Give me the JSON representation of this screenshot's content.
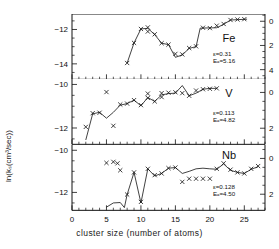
{
  "chart_data": {
    "type": "scatter",
    "title": "",
    "xlabel": "cluster size  (number of atoms)",
    "ylabel_left": "ln(kₛ(cm³/sec))",
    "ylabel_right": "activation  energies  (kcal/mole)",
    "xlim": [
      0,
      28
    ],
    "xticks": [
      0,
      5,
      10,
      15,
      20,
      25
    ],
    "xticklabels": [
      "0",
      "5",
      "10",
      "15",
      "20",
      "25"
    ],
    "xminor_step": 1,
    "grid": false,
    "legend": "none",
    "panels": [
      {
        "name": "Fe",
        "label": "Fe",
        "epsilon_label": "ε=0.31",
        "ea_label": "Eₐ=5.16",
        "epsilon": 0.31,
        "activation_energy": 5.16,
        "ylim": [
          -14.9,
          -11.1
        ],
        "yticks": [
          -12,
          -14
        ],
        "yticklabels": [
          "−12",
          "−14"
        ],
        "ylim_right": [
          -0.6,
          4.8
        ],
        "yticks_right": [
          0,
          2,
          4
        ],
        "yticklabels_right": [
          "0",
          "2",
          "4"
        ],
        "points": [
          {
            "x": 8,
            "y": -13.95
          },
          {
            "x": 9,
            "y": -12.78
          },
          {
            "x": 10,
            "y": -11.97
          },
          {
            "x": 11,
            "y": -11.88
          },
          {
            "x": 11,
            "y": -12.12
          },
          {
            "x": 12,
            "y": -12.28
          },
          {
            "x": 13,
            "y": -12.8
          },
          {
            "x": 14,
            "y": -12.88
          },
          {
            "x": 15,
            "y": -13.42
          },
          {
            "x": 16,
            "y": -13.45
          },
          {
            "x": 17,
            "y": -13.08
          },
          {
            "x": 18,
            "y": -12.98
          },
          {
            "x": 19,
            "y": -11.9
          },
          {
            "x": 20,
            "y": -11.92
          },
          {
            "x": 21,
            "y": -11.78
          },
          {
            "x": 22,
            "y": -11.68
          },
          {
            "x": 23,
            "y": -11.45
          },
          {
            "x": 24,
            "y": -11.42
          },
          {
            "x": 25,
            "y": -11.4
          }
        ],
        "curve": [
          {
            "x": 8,
            "y": -13.95
          },
          {
            "x": 9,
            "y": -12.78
          },
          {
            "x": 10,
            "y": -11.97
          },
          {
            "x": 11,
            "y": -11.93
          },
          {
            "x": 12,
            "y": -12.3
          },
          {
            "x": 13,
            "y": -12.8
          },
          {
            "x": 14,
            "y": -12.88
          },
          {
            "x": 15,
            "y": -13.62
          },
          {
            "x": 16,
            "y": -13.48
          },
          {
            "x": 17,
            "y": -13.1
          },
          {
            "x": 18,
            "y": -13.0
          },
          {
            "x": 18.6,
            "y": -11.92
          },
          {
            "x": 21,
            "y": -11.9
          },
          {
            "x": 22,
            "y": -11.7
          },
          {
            "x": 23,
            "y": -11.45
          },
          {
            "x": 25.4,
            "y": -11.4
          }
        ]
      },
      {
        "name": "V",
        "label": "V",
        "epsilon_label": "ε=0.113",
        "ea_label": "Eₐ=4.82",
        "epsilon": 0.113,
        "activation_energy": 4.82,
        "ylim": [
          -12.75,
          -9.75
        ],
        "yticks": [
          -10,
          -12
        ],
        "yticklabels": [
          "−10",
          "−12"
        ],
        "ylim_right": [
          -0.75,
          2.9
        ],
        "yticks_right": [
          0,
          2
        ],
        "yticklabels_right": [
          "0",
          "2"
        ],
        "points": [
          {
            "x": 2,
            "y": -11.95
          },
          {
            "x": 3,
            "y": -11.32
          },
          {
            "x": 4,
            "y": -11.3
          },
          {
            "x": 5,
            "y": -10.35
          },
          {
            "x": 6,
            "y": -11.9
          },
          {
            "x": 7,
            "y": -10.92
          },
          {
            "x": 8,
            "y": -10.88
          },
          {
            "x": 9,
            "y": -10.72
          },
          {
            "x": 10,
            "y": -10.95
          },
          {
            "x": 11,
            "y": -10.42
          },
          {
            "x": 11,
            "y": -10.62
          },
          {
            "x": 12,
            "y": -10.78
          },
          {
            "x": 13,
            "y": -10.4
          },
          {
            "x": 13,
            "y": -10.58
          },
          {
            "x": 14,
            "y": -10.38
          },
          {
            "x": 15,
            "y": -10.36
          },
          {
            "x": 16,
            "y": -10.4
          },
          {
            "x": 17,
            "y": -10.52
          },
          {
            "x": 18,
            "y": -10.28
          },
          {
            "x": 19,
            "y": -10.22
          },
          {
            "x": 20,
            "y": -10.2
          },
          {
            "x": 21,
            "y": -10.18
          }
        ],
        "curve": [
          {
            "x": 2,
            "y": -12.55
          },
          {
            "x": 3,
            "y": -11.35
          },
          {
            "x": 4,
            "y": -11.28
          },
          {
            "x": 5,
            "y": -11.55
          },
          {
            "x": 6,
            "y": -11.28
          },
          {
            "x": 7,
            "y": -10.95
          },
          {
            "x": 8,
            "y": -10.88
          },
          {
            "x": 9,
            "y": -10.72
          },
          {
            "x": 10,
            "y": -10.98
          },
          {
            "x": 11,
            "y": -10.6
          },
          {
            "x": 12,
            "y": -10.78
          },
          {
            "x": 13,
            "y": -10.48
          },
          {
            "x": 14,
            "y": -10.42
          },
          {
            "x": 15,
            "y": -10.4
          },
          {
            "x": 16,
            "y": -10.05
          },
          {
            "x": 17,
            "y": -10.52
          },
          {
            "x": 18,
            "y": -10.4
          },
          {
            "x": 19,
            "y": -10.22
          },
          {
            "x": 20,
            "y": -10.18
          },
          {
            "x": 21,
            "y": -10.18
          }
        ]
      },
      {
        "name": "Nb",
        "label": "Nb",
        "epsilon_label": "ε=0.128",
        "ea_label": "Eₐ=4.50",
        "epsilon": 0.128,
        "activation_energy": 4.5,
        "ylim": [
          -12.85,
          -9.75
        ],
        "yticks": [
          -10,
          -12
        ],
        "yticklabels": [
          "−10",
          "−12"
        ],
        "ylim_right": [
          -0.75,
          2.9
        ],
        "yticks_right": [
          0,
          2
        ],
        "yticklabels_right": [
          "0",
          "2"
        ],
        "points": [
          {
            "x": 5,
            "y": -10.6
          },
          {
            "x": 6,
            "y": -10.55
          },
          {
            "x": 6.6,
            "y": -10.62
          },
          {
            "x": 7,
            "y": -10.95
          },
          {
            "x": 8,
            "y": -12.1
          },
          {
            "x": 9,
            "y": -11.05
          },
          {
            "x": 10,
            "y": -12.45
          },
          {
            "x": 11,
            "y": -10.88
          },
          {
            "x": 12,
            "y": -11.18
          },
          {
            "x": 13,
            "y": -11.1
          },
          {
            "x": 14,
            "y": -10.85
          },
          {
            "x": 15,
            "y": -10.82
          },
          {
            "x": 16,
            "y": -11.5
          },
          {
            "x": 17,
            "y": -11.35
          },
          {
            "x": 18,
            "y": -11.35
          },
          {
            "x": 19,
            "y": -11.35
          },
          {
            "x": 20,
            "y": -11.35
          },
          {
            "x": 21,
            "y": -10.88
          },
          {
            "x": 22,
            "y": -10.62
          },
          {
            "x": 23,
            "y": -10.92
          },
          {
            "x": 24,
            "y": -11.05
          },
          {
            "x": 25,
            "y": -11.1
          },
          {
            "x": 26,
            "y": -10.88
          },
          {
            "x": 27,
            "y": -10.75
          }
        ],
        "curve": [
          {
            "x": 5,
            "y": -12.7
          },
          {
            "x": 6,
            "y": -12.5
          },
          {
            "x": 7,
            "y": -12.48
          },
          {
            "x": 7.6,
            "y": -12.72
          },
          {
            "x": 8,
            "y": -12.1
          },
          {
            "x": 9,
            "y": -11.05
          },
          {
            "x": 10,
            "y": -12.5
          },
          {
            "x": 11,
            "y": -10.88
          },
          {
            "x": 12,
            "y": -11.22
          },
          {
            "x": 13,
            "y": -11.1
          },
          {
            "x": 14,
            "y": -10.85
          },
          {
            "x": 15,
            "y": -10.82
          },
          {
            "x": 16,
            "y": -11.1
          },
          {
            "x": 17,
            "y": -11.0
          },
          {
            "x": 18,
            "y": -10.88
          },
          {
            "x": 19,
            "y": -10.85
          },
          {
            "x": 20,
            "y": -10.88
          },
          {
            "x": 21,
            "y": -10.9
          },
          {
            "x": 22,
            "y": -10.65
          },
          {
            "x": 23,
            "y": -10.95
          },
          {
            "x": 24,
            "y": -11.05
          },
          {
            "x": 25,
            "y": -11.1
          },
          {
            "x": 26,
            "y": -10.9
          },
          {
            "x": 27,
            "y": -10.78
          }
        ]
      }
    ]
  }
}
